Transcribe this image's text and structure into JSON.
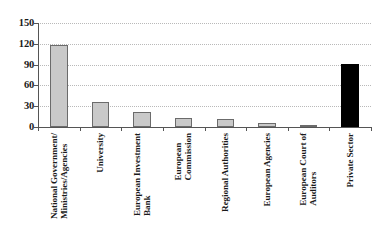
{
  "chart_data": {
    "type": "bar",
    "title": "",
    "subtitle": "",
    "xlabel": "",
    "ylabel": "",
    "ylim": [
      0,
      150
    ],
    "yticks": [
      0,
      30,
      60,
      90,
      120,
      150
    ],
    "grid": true,
    "legend": false,
    "categories": [
      "National Government/\nMinistries/Agencies",
      "University",
      "European Investment\nBank",
      "European\nCommission",
      "Regional Authorities",
      "European Agencies",
      "European Court of\nAuditors",
      "Private Sector"
    ],
    "values": [
      118,
      36,
      22,
      13,
      11,
      6,
      2,
      91
    ],
    "bar_colors": [
      "#c9c9c9",
      "#c9c9c9",
      "#c9c9c9",
      "#c9c9c9",
      "#c9c9c9",
      "#c9c9c9",
      "#c9c9c9",
      "#000000"
    ],
    "bar_edge_colors": [
      "#6b6b6b",
      "#6b6b6b",
      "#6b6b6b",
      "#6b6b6b",
      "#6b6b6b",
      "#6b6b6b",
      "#6b6b6b",
      "#000000"
    ],
    "colors": {
      "gray_fill": "#c9c9c9",
      "gray_edge": "#6b6b6b",
      "black_fill": "#000000",
      "axis": "#555555",
      "gridline": "#b9b9b9",
      "text": "#1a1a1a",
      "background": "#ffffff"
    }
  }
}
